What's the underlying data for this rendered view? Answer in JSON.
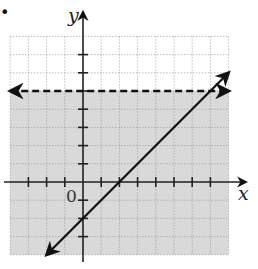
{
  "chart_data": {
    "type": "line",
    "title": "",
    "xlabel": "x",
    "ylabel": "y",
    "origin_label": "0",
    "xlim": [
      -4,
      8
    ],
    "ylim": [
      -4,
      8
    ],
    "grid": true,
    "grid_style": "dotted",
    "series": [
      {
        "name": "boundary y = 5",
        "style": "dashed",
        "equation": "y = 5",
        "points": [
          [
            -4,
            5
          ],
          [
            8,
            5
          ]
        ]
      },
      {
        "name": "line y = x - 2",
        "style": "solid",
        "equation": "y = x - 2",
        "points": [
          [
            -2,
            -4
          ],
          [
            8,
            6
          ]
        ]
      }
    ],
    "shaded_region": {
      "description": "region below dashed line y = 5",
      "inequality": "y < 5",
      "color": "#d9d9d9"
    },
    "x_ticks": [
      -3,
      -2,
      -1,
      1,
      2,
      3,
      4,
      5,
      6,
      7
    ],
    "y_ticks": [
      -3,
      -2,
      -1,
      1,
      2,
      3,
      4,
      5,
      6,
      7
    ]
  },
  "marker": "•"
}
